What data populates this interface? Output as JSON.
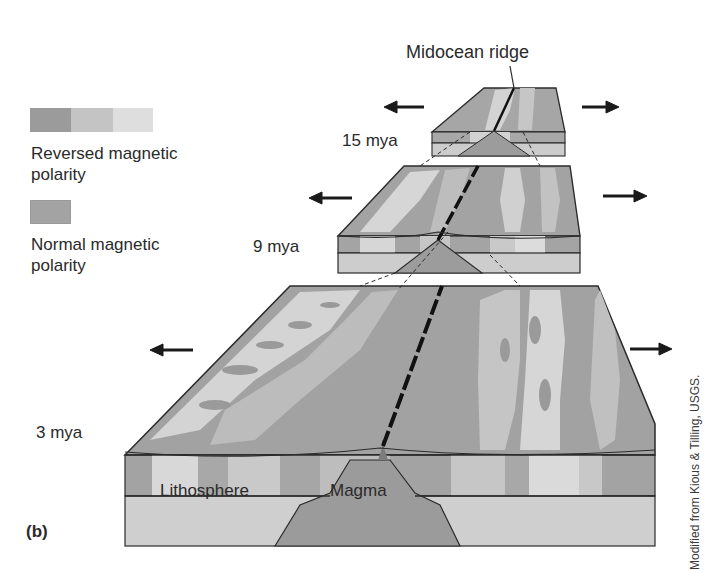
{
  "figure": {
    "panel_label": "(b)",
    "credit": "Modified from Kious & Tilling, USGS.",
    "title_label": "Midocean ridge"
  },
  "legend": {
    "reversed": {
      "label_line1": "Reversed magnetic",
      "label_line2": "polarity",
      "swatch_colors": [
        "#9b9b9b",
        "#c4c4c4",
        "#dedede"
      ]
    },
    "normal": {
      "label_line1": "Normal  magnetic",
      "label_line2": "polarity",
      "swatch_color": "#a3a3a3"
    }
  },
  "blocks": [
    {
      "age": "15 mya",
      "stage": "top"
    },
    {
      "age": "9 mya",
      "stage": "middle"
    },
    {
      "age": "3 mya",
      "stage": "bottom"
    }
  ],
  "layers": {
    "lithosphere": "Lithosphere",
    "magma": "Magma"
  },
  "colors": {
    "normal": "#a0a0a0",
    "reversed_light": "#d6d6d6",
    "reversed_mid": "#bdbdbd",
    "lithosphere": "#cfcfcf",
    "magma": "#9a9a9a",
    "outline": "#2b2b2b",
    "arrow": "#1a1a1a"
  },
  "arrows": {
    "direction_left": "spreading-left",
    "direction_right": "spreading-right"
  }
}
